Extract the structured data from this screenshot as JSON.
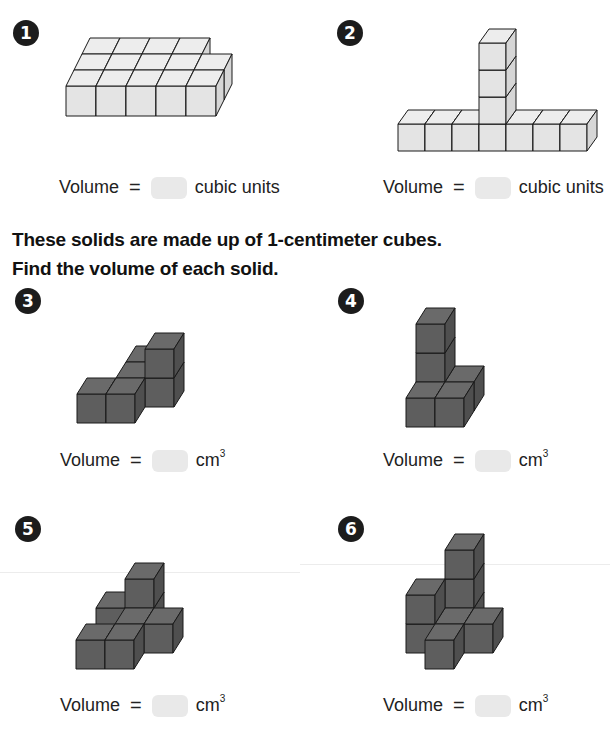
{
  "page": {
    "instructions": [
      "These solids are made up of 1-centimeter cubes.",
      "Find the volume of each solid."
    ]
  },
  "problems": [
    {
      "number": "1",
      "label": "Volume =",
      "eq": "=",
      "prefix": "Volume",
      "unit": "cubic units",
      "unit_sup": "",
      "answer": "",
      "cube_color": "light"
    },
    {
      "number": "2",
      "label": "Volume =",
      "eq": "=",
      "prefix": "Volume",
      "unit": "cubic units",
      "unit_sup": "",
      "answer": "",
      "cube_color": "light"
    },
    {
      "number": "3",
      "eq": "=",
      "prefix": "Volume",
      "unit": "cm",
      "unit_sup": "3",
      "answer": "",
      "cube_color": "dark"
    },
    {
      "number": "4",
      "eq": "=",
      "prefix": "Volume",
      "unit": "cm",
      "unit_sup": "3",
      "answer": "",
      "cube_color": "dark"
    },
    {
      "number": "5",
      "eq": "=",
      "prefix": "Volume",
      "unit": "cm",
      "unit_sup": "3",
      "answer": "",
      "cube_color": "dark"
    },
    {
      "number": "6",
      "eq": "=",
      "prefix": "Volume",
      "unit": "cm",
      "unit_sup": "3",
      "answer": "",
      "cube_color": "dark"
    }
  ],
  "colors": {
    "light_front": "#e4e4e4",
    "light_top": "#ededed",
    "light_side": "#d6d6d6",
    "dark_front": "#5e5e5e",
    "dark_top": "#6a6a6a",
    "dark_side": "#4f4f4f",
    "answer_box": "#e9e9e9",
    "badge": "#1c1c1c"
  }
}
